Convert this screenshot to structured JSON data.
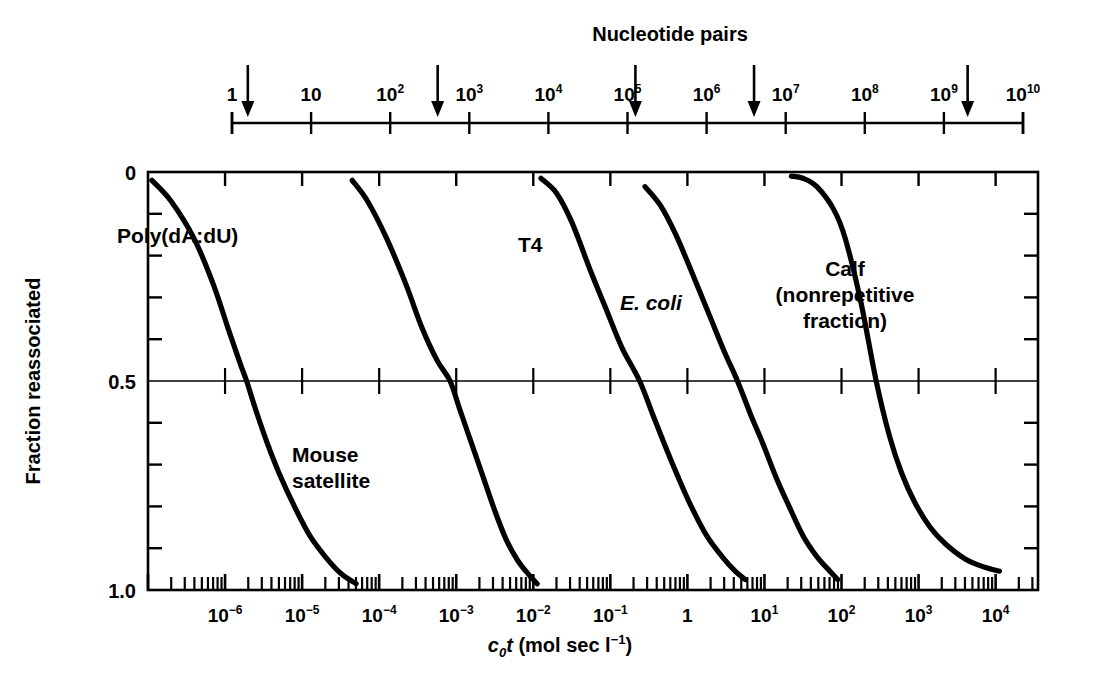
{
  "figure": {
    "kind": "cot-curve",
    "background": "#ffffff",
    "ink": "#000000"
  },
  "top_axis": {
    "title": "Nucleotide pairs",
    "tick_labels": [
      "1",
      "10",
      "10²",
      "10³",
      "10⁴",
      "10⁵",
      "10⁶",
      "10⁷",
      "10⁸",
      "10⁹",
      "10¹⁰"
    ],
    "tick_bases": [
      "1",
      "10",
      "10",
      "10",
      "10",
      "10",
      "10",
      "10",
      "10",
      "10",
      "10"
    ],
    "tick_exponents": [
      "",
      "",
      "2",
      "3",
      "4",
      "5",
      "6",
      "7",
      "8",
      "9",
      "10"
    ],
    "exponents_numeric": [
      0,
      1,
      2,
      3,
      4,
      5,
      6,
      7,
      8,
      9,
      10
    ],
    "arrows": [
      {
        "label": "Poly(dA:dU)",
        "exponent": 0.2
      },
      {
        "label": "Mouse satellite",
        "exponent": 2.6
      },
      {
        "label": "T4",
        "exponent": 5.1
      },
      {
        "label": "E. coli",
        "exponent": 6.6
      },
      {
        "label": "Calf (nonrepetitive fraction)",
        "exponent": 9.3
      }
    ]
  },
  "x_axis": {
    "title_parts": {
      "c": "c",
      "sub0": "0",
      "t": "t",
      "rest": " (mol sec l",
      "sup": "-1",
      "close": ")"
    },
    "title_plain": "c₀t (mol sec l⁻¹)",
    "scale": "log",
    "min_exponent": -7.0,
    "max_exponent": 4.55,
    "tick_labels": [
      "10⁻⁶",
      "10⁻⁵",
      "10⁻⁴",
      "10⁻³",
      "10⁻²",
      "10⁻¹",
      "1",
      "10",
      "10²",
      "10³",
      "10⁴"
    ],
    "tick_exponents": [
      -6,
      -5,
      -4,
      -3,
      -2,
      -1,
      0,
      1,
      2,
      3,
      4
    ],
    "minor_ticks": true
  },
  "y_axis": {
    "title": "Fraction reassociated",
    "labels": [
      "0",
      "0.5",
      "1.0"
    ],
    "label_values": [
      0,
      0.5,
      1.0
    ],
    "min": 0,
    "max": 1.0,
    "minor_tick_step": 0.1,
    "gridline_at": 0.5
  },
  "chart_data": {
    "type": "line",
    "title": "",
    "xlabel": "c₀t (mol sec l⁻¹)",
    "ylabel": "Fraction reassociated",
    "xscale": "log",
    "xlim": [
      -7.0,
      4.55
    ],
    "ylim": [
      0,
      1.0
    ],
    "ylim_inverted": true,
    "grid": "single horizontal line at 0.5",
    "legend": "inline labels on curves",
    "series": [
      {
        "name": "Poly(dA:dU)",
        "label_pos": {
          "x_exponent": -6.25,
          "y": 0.16
        },
        "cot_half_exponent": -5.72,
        "points_log_x": [
          -6.95,
          -6.7,
          -6.4,
          -6.15,
          -5.95,
          -5.8,
          -5.72,
          -5.6,
          -5.45,
          -5.3,
          -5.1,
          -4.9,
          -4.7,
          -4.5,
          -4.3
        ],
        "points_y": [
          0.02,
          0.07,
          0.16,
          0.27,
          0.38,
          0.46,
          0.5,
          0.57,
          0.65,
          0.72,
          0.8,
          0.87,
          0.92,
          0.96,
          0.985
        ]
      },
      {
        "name": "Mouse satellite",
        "label_pos": {
          "x_exponent": -3.85,
          "y": 0.7
        },
        "cot_half_exponent": -3.08,
        "points_log_x": [
          -4.35,
          -4.15,
          -3.9,
          -3.65,
          -3.45,
          -3.25,
          -3.08,
          -2.95,
          -2.8,
          -2.65,
          -2.5,
          -2.35,
          -2.2,
          -2.05,
          -1.95
        ],
        "points_y": [
          0.02,
          0.07,
          0.16,
          0.27,
          0.37,
          0.45,
          0.5,
          0.57,
          0.65,
          0.73,
          0.81,
          0.88,
          0.93,
          0.965,
          0.985
        ]
      },
      {
        "name": "T4",
        "label_pos": {
          "x_exponent": -1.6,
          "y": 0.16
        },
        "cot_half_exponent": -0.62,
        "points_log_x": [
          -1.9,
          -1.7,
          -1.5,
          -1.25,
          -1.05,
          -0.85,
          -0.62,
          -0.45,
          -0.3,
          -0.12,
          0.05,
          0.25,
          0.45,
          0.62,
          0.75
        ],
        "points_y": [
          0.015,
          0.05,
          0.12,
          0.24,
          0.33,
          0.42,
          0.5,
          0.58,
          0.65,
          0.73,
          0.8,
          0.87,
          0.92,
          0.955,
          0.975
        ]
      },
      {
        "name": "E. coli",
        "label_pos": {
          "x_exponent": -0.05,
          "y": 0.38
        },
        "cot_half_exponent": 0.65,
        "points_log_x": [
          -0.55,
          -0.35,
          -0.15,
          0.08,
          0.28,
          0.48,
          0.65,
          0.82,
          0.98,
          1.15,
          1.32,
          1.5,
          1.68,
          1.85,
          1.95
        ],
        "points_y": [
          0.035,
          0.08,
          0.15,
          0.25,
          0.34,
          0.43,
          0.5,
          0.58,
          0.65,
          0.73,
          0.8,
          0.87,
          0.92,
          0.955,
          0.975
        ]
      },
      {
        "name": "Calf (nonrepetitive fraction)",
        "label_pos": {
          "x_exponent": 1.35,
          "y": 0.26
        },
        "cot_half_exponent": 2.45,
        "points_log_x": [
          1.35,
          1.5,
          1.68,
          1.9,
          2.05,
          2.25,
          2.45,
          2.62,
          2.78,
          2.95,
          3.15,
          3.35,
          3.6,
          3.85,
          4.05
        ],
        "points_y": [
          0.01,
          0.015,
          0.035,
          0.09,
          0.16,
          0.31,
          0.5,
          0.63,
          0.72,
          0.79,
          0.85,
          0.89,
          0.925,
          0.945,
          0.955
        ]
      }
    ]
  },
  "curve_labels": {
    "poly": {
      "line1": "Poly(dA:dU)"
    },
    "mouse": {
      "line1": "Mouse",
      "line2": "satellite"
    },
    "t4": {
      "line1": "T4"
    },
    "ecoli": {
      "line1": "E. coli"
    },
    "calf": {
      "line1": "Calf",
      "line2": "(nonrepetitive",
      "line3": "fraction)"
    }
  }
}
